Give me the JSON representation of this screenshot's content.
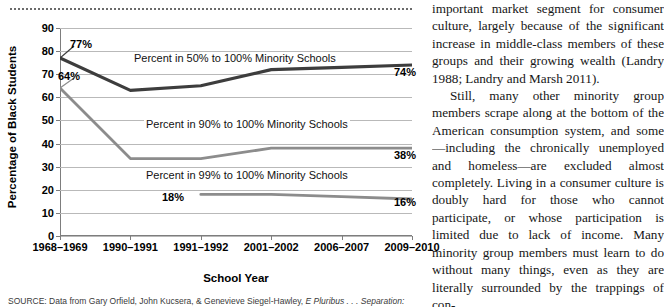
{
  "figure": {
    "source_prefix": "SOURCE:",
    "source_text": "Data from Gary Orfield, John Kucsera, & Genevieve Siegel-Hawley,",
    "source_italic": "E Pluribus . . . Separation:"
  },
  "chart_data": {
    "type": "line",
    "title": "",
    "xlabel": "School Year",
    "ylabel": "Percentage of Black Students",
    "ylim": [
      0,
      90
    ],
    "yticks": [
      0,
      10,
      20,
      30,
      40,
      50,
      60,
      70,
      80,
      90
    ],
    "grid": true,
    "legend": "inline-labels",
    "categories": [
      "1968–1969",
      "1990–1991",
      "1991–1992",
      "2001–2002",
      "2006–2007",
      "2009–2010"
    ],
    "series": [
      {
        "name": "Percent in 50% to 100% Minority Schools",
        "color": "#3d3d3d",
        "values": [
          77,
          63,
          65,
          72,
          73,
          74
        ],
        "start_label": "77%",
        "end_label": "74%"
      },
      {
        "name": "Percent in 90% to 100% Minority Schools",
        "color": "#8c8c8c",
        "values": [
          64,
          33.5,
          33.5,
          38,
          38,
          38
        ],
        "start_label": "64%",
        "end_label": "38%"
      },
      {
        "name": "Percent in 99% to 100% Minority Schools",
        "color": "#8c8c8c",
        "values": [
          null,
          null,
          18,
          18,
          17,
          16
        ],
        "start_label": "18%",
        "end_label": "16%"
      }
    ]
  },
  "article": {
    "paragraph_1": "important market segment for consumer culture, largely because of the significant increase in middle-class members of these groups and their growing wealth (Landry 1988; Landry and Marsh 2011).",
    "paragraph_2": "Still, many other minority group members scrape along at the bottom of the American consumption system, and some—including the chronically unemployed and homeless—are excluded almost completely. Living in a consumer culture is doubly hard for those who cannot participate, or whose participation is limited due to lack of income. Many minority group members must learn to do without many things, even as they are literally surrounded by the trappings of con-"
  }
}
